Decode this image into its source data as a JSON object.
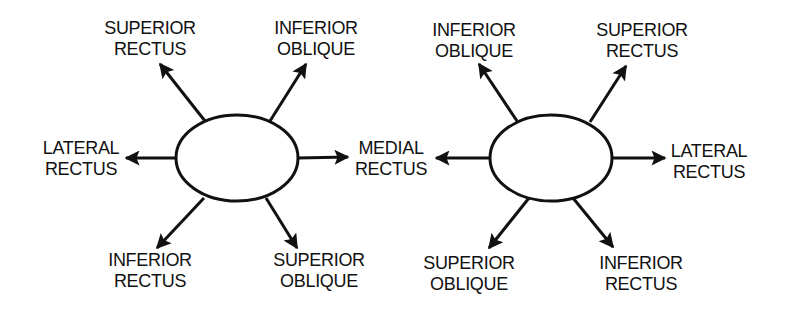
{
  "colors": {
    "background": "#ffffff",
    "ink": "#111111"
  },
  "diagrams": [
    {
      "id": "left-eye",
      "eye": {
        "cx": 237,
        "cy": 158,
        "rx": 61,
        "ry": 43
      },
      "muscles": [
        {
          "key": "superior-rectus",
          "line1": "SUPERIOR",
          "line2": "RECTUS",
          "label_x": 150,
          "label_y": 18,
          "arrow": {
            "x1": 205,
            "y1": 121,
            "x2": 160,
            "y2": 64
          }
        },
        {
          "key": "inferior-oblique",
          "line1": "INFERIOR",
          "line2": "OBLIQUE",
          "label_x": 316,
          "label_y": 18,
          "arrow": {
            "x1": 270,
            "y1": 121,
            "x2": 306,
            "y2": 64
          }
        },
        {
          "key": "lateral-rectus",
          "line1": "LATERAL",
          "line2": "RECTUS",
          "label_x": 81,
          "label_y": 138,
          "arrow": {
            "x1": 176,
            "y1": 158,
            "x2": 126,
            "y2": 158
          }
        },
        {
          "key": "medial-rectus",
          "line1": "MEDIAL",
          "line2": "RECTUS",
          "label_x": 391,
          "label_y": 138,
          "arrow": {
            "x1": 298,
            "y1": 158,
            "x2": 348,
            "y2": 157
          }
        },
        {
          "key": "inferior-rectus",
          "line1": "INFERIOR",
          "line2": "RECTUS",
          "label_x": 150,
          "label_y": 250,
          "arrow": {
            "x1": 204,
            "y1": 198,
            "x2": 157,
            "y2": 248
          }
        },
        {
          "key": "superior-oblique",
          "line1": "SUPERIOR",
          "line2": "OBLIQUE",
          "label_x": 319,
          "label_y": 250,
          "arrow": {
            "x1": 266,
            "y1": 198,
            "x2": 297,
            "y2": 248
          }
        }
      ]
    },
    {
      "id": "right-eye",
      "eye": {
        "cx": 551,
        "cy": 158,
        "rx": 61,
        "ry": 43
      },
      "muscles": [
        {
          "key": "inferior-oblique",
          "line1": "INFERIOR",
          "line2": "OBLIQUE",
          "label_x": 474,
          "label_y": 20,
          "arrow": {
            "x1": 517,
            "y1": 121,
            "x2": 479,
            "y2": 64
          }
        },
        {
          "key": "superior-rectus",
          "line1": "SUPERIOR",
          "line2": "RECTUS",
          "label_x": 642,
          "label_y": 20,
          "arrow": {
            "x1": 590,
            "y1": 122,
            "x2": 626,
            "y2": 66
          }
        },
        {
          "key": "medial-rectus",
          "line1": "MEDIAL",
          "line2": "RECTUS",
          "label_x": 391,
          "label_y": 138,
          "arrow": {
            "x1": 490,
            "y1": 158,
            "x2": 436,
            "y2": 158
          },
          "label_shared": true
        },
        {
          "key": "lateral-rectus",
          "line1": "LATERAL",
          "line2": "RECTUS",
          "label_x": 709,
          "label_y": 141,
          "arrow": {
            "x1": 613,
            "y1": 158,
            "x2": 665,
            "y2": 158
          }
        },
        {
          "key": "superior-oblique",
          "line1": "SUPERIOR",
          "line2": "OBLIQUE",
          "label_x": 469,
          "label_y": 253,
          "arrow": {
            "x1": 529,
            "y1": 198,
            "x2": 489,
            "y2": 248
          }
        },
        {
          "key": "inferior-rectus",
          "line1": "INFERIOR",
          "line2": "RECTUS",
          "label_x": 641,
          "label_y": 253,
          "arrow": {
            "x1": 573,
            "y1": 198,
            "x2": 613,
            "y2": 247
          }
        }
      ]
    }
  ]
}
